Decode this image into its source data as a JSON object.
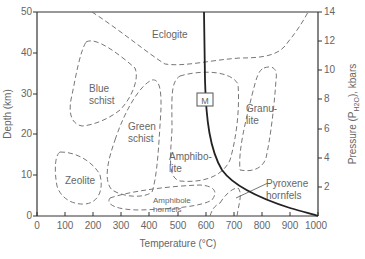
{
  "figure": {
    "type": "metamorphic facies diagram",
    "x_axis": {
      "title": "Temperature (°C)",
      "ticks": [
        "0",
        "100",
        "200",
        "300",
        "400",
        "500",
        "600",
        "700",
        "800",
        "900",
        "1000"
      ],
      "range": [
        0,
        1000
      ]
    },
    "y_axis_left": {
      "title": "Depth (km)",
      "ticks": [
        "0",
        "10",
        "20",
        "30",
        "40",
        "50"
      ],
      "range": [
        0,
        50
      ]
    },
    "y_axis_right": {
      "title": "Pressure (P",
      "title_sub": "H2O",
      "title_end": "), kbars",
      "ticks": [
        "2",
        "4",
        "6",
        "8",
        "10",
        "12",
        "14"
      ],
      "range": [
        0,
        14
      ]
    },
    "facies": [
      {
        "name": "eclogite",
        "line1": "Eclogite",
        "line2": ""
      },
      {
        "name": "blue-schist",
        "line1": "Blue",
        "line2": "schist"
      },
      {
        "name": "green-schist",
        "line1": "Green",
        "line2": "schist"
      },
      {
        "name": "zeolite",
        "line1": "Zeolite",
        "line2": ""
      },
      {
        "name": "amphibolite",
        "line1": "Amphibo-",
        "line2": "lite"
      },
      {
        "name": "granulite",
        "line1": "Granu-",
        "line2": "lite"
      },
      {
        "name": "amphibole-hornfels",
        "line1": "Amphibole",
        "line2": "hornfels"
      },
      {
        "name": "pyroxene-hornfels",
        "line1": "Pyroxene",
        "line2": "hornfels"
      }
    ],
    "melting_curve_label": "M",
    "colors": {
      "axis": "#333333",
      "dashed_boundary": "#777777",
      "melting_curve": "#222222",
      "text": "#666666"
    }
  }
}
